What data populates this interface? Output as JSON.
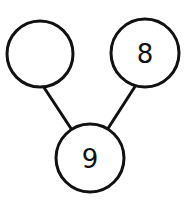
{
  "diagram": {
    "type": "number-bond",
    "whole": {
      "value": "9",
      "cx": 90,
      "cy": 158,
      "r": 34
    },
    "parts": [
      {
        "value": "",
        "cx": 40,
        "cy": 54,
        "r": 33
      },
      {
        "value": "8",
        "cx": 145,
        "cy": 53,
        "r": 34
      }
    ],
    "connectors": [
      {
        "x1": 43,
        "y1": 86,
        "x2": 72,
        "y2": 130
      },
      {
        "x1": 136,
        "y1": 85,
        "x2": 107,
        "y2": 130
      }
    ],
    "colors": {
      "stroke": "#111111",
      "background": "#ffffff"
    }
  }
}
